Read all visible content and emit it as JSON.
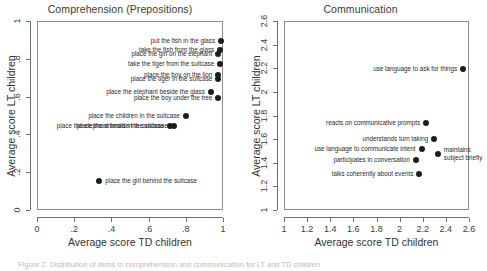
{
  "figure": {
    "caption_partial": "Figure 2. Distribution of items in comprehension and communication for LT and TD children"
  },
  "chart_data": [
    {
      "type": "scatter",
      "title": "Comprehension (Prepositions)",
      "xlabel": "Average score TD children",
      "ylabel": "Average score LT children",
      "xlim": [
        0,
        1
      ],
      "ylim": [
        0,
        1
      ],
      "xticks": [
        "0",
        ".2",
        ".4",
        ".6",
        ".8",
        "1"
      ],
      "xtickvals": [
        0,
        0.2,
        0.4,
        0.6,
        0.8,
        1
      ],
      "yticks": [
        "0",
        ".2",
        ".4",
        ".6",
        ".8",
        "1"
      ],
      "ytickvals": [
        0,
        0.2,
        0.4,
        0.6,
        0.8,
        1
      ],
      "grid": false,
      "legend": "none",
      "points": [
        {
          "label": "put the fish in the glass",
          "x": 0.99,
          "y": 0.895,
          "side": "left"
        },
        {
          "label": "take the fish from the glass",
          "x": 0.985,
          "y": 0.845,
          "side": "left"
        },
        {
          "label": "place the girl on the elephant",
          "x": 0.975,
          "y": 0.825,
          "side": "left"
        },
        {
          "label": "take the tiger from the suitcase",
          "x": 0.985,
          "y": 0.775,
          "side": "left"
        },
        {
          "label": "place the boy on the lion",
          "x": 0.975,
          "y": 0.715,
          "side": "left"
        },
        {
          "label": "place the tiger in the suitcase",
          "x": 0.975,
          "y": 0.695,
          "side": "left"
        },
        {
          "label": "place the elephant beside the glass",
          "x": 0.935,
          "y": 0.625,
          "side": "left"
        },
        {
          "label": "place the boy under the tree",
          "x": 0.975,
          "y": 0.592,
          "side": "left"
        },
        {
          "label": "place the children in the suitcase",
          "x": 0.8,
          "y": 0.495,
          "side": "left"
        },
        {
          "label": "place the animals in the suitcase",
          "x": 0.735,
          "y": 0.447,
          "side": "left"
        },
        {
          "label": "place the elephant beside the suitcase",
          "x": 0.715,
          "y": 0.442,
          "side": "left"
        },
        {
          "label": "place the girl behind the suitcase",
          "x": 0.335,
          "y": 0.152,
          "side": "right"
        }
      ]
    },
    {
      "type": "scatter",
      "title": "Communication",
      "xlabel": "Average score TD children",
      "ylabel": "Average score LT children",
      "xlim": [
        1,
        2.6
      ],
      "ylim": [
        1,
        2.6
      ],
      "xticks": [
        "1",
        "1.2",
        "1.4",
        "1.6",
        "1.8",
        "2",
        "2.2",
        "2.4",
        "2.6"
      ],
      "xtickvals": [
        1,
        1.2,
        1.4,
        1.6,
        1.8,
        2,
        2.2,
        2.4,
        2.6
      ],
      "yticks": [
        "1",
        "1.2",
        "1.4",
        "1.6",
        "1.8",
        "2",
        "2.2",
        "2.4",
        "2.6"
      ],
      "ytickvals": [
        1,
        1.2,
        1.4,
        1.6,
        1.8,
        2,
        2.2,
        2.4,
        2.6
      ],
      "grid": false,
      "legend": "none",
      "points": [
        {
          "label": "use language to ask for things",
          "x": 2.55,
          "y": 2.195,
          "side": "left"
        },
        {
          "label": "reacts on communicative prompts",
          "x": 2.23,
          "y": 1.74,
          "side": "left"
        },
        {
          "label": "understands turn taking",
          "x": 2.3,
          "y": 1.605,
          "side": "left"
        },
        {
          "label": "use language to communicate intent",
          "x": 2.19,
          "y": 1.515,
          "side": "left"
        },
        {
          "label": "maintains subject briefly",
          "x": 2.33,
          "y": 1.475,
          "side": "right",
          "wrap": true
        },
        {
          "label": "participates in conversation",
          "x": 2.14,
          "y": 1.425,
          "side": "left"
        },
        {
          "label": "talks coherently about events",
          "x": 2.17,
          "y": 1.305,
          "side": "left"
        }
      ]
    }
  ]
}
